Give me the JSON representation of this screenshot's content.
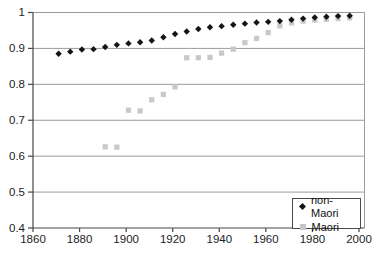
{
  "chart_data": {
    "type": "scatter",
    "title": "",
    "xlabel": "",
    "ylabel": "",
    "xlim": [
      1860,
      2000
    ],
    "ylim": [
      0.4,
      1.0
    ],
    "x_tick_values": [
      1860,
      1880,
      1900,
      1920,
      1940,
      1960,
      1980,
      2000
    ],
    "x_tick_labels": [
      "1860",
      "1880",
      "1900",
      "1920",
      "1940",
      "1960",
      "1980",
      "2000"
    ],
    "y_tick_values": [
      0.4,
      0.5,
      0.6,
      0.7,
      0.8,
      0.9,
      1
    ],
    "y_tick_labels": [
      "0.4",
      "0.5",
      "0.6",
      "0.7",
      "0.8",
      "0.9",
      "1"
    ],
    "grid": "horizontal",
    "legend_position": "bottom-right",
    "colors": {
      "background": "#ffffff",
      "grid": "#9b9b9b",
      "axis": "#474747",
      "text": "#1c1c1c",
      "legend_border": "#4a4a4a"
    },
    "series": [
      {
        "name": "non-Maori",
        "marker": "diamond",
        "color": "#151515",
        "points": [
          [
            1871,
            0.885
          ],
          [
            1876,
            0.891
          ],
          [
            1881,
            0.897
          ],
          [
            1886,
            0.898
          ],
          [
            1891,
            0.904
          ],
          [
            1896,
            0.91
          ],
          [
            1901,
            0.914
          ],
          [
            1906,
            0.917
          ],
          [
            1911,
            0.922
          ],
          [
            1916,
            0.931
          ],
          [
            1921,
            0.94
          ],
          [
            1926,
            0.947
          ],
          [
            1931,
            0.954
          ],
          [
            1936,
            0.959
          ],
          [
            1941,
            0.962
          ],
          [
            1946,
            0.966
          ],
          [
            1951,
            0.969
          ],
          [
            1956,
            0.972
          ],
          [
            1961,
            0.974
          ],
          [
            1966,
            0.976
          ],
          [
            1971,
            0.98
          ],
          [
            1976,
            0.983
          ],
          [
            1981,
            0.986
          ],
          [
            1986,
            0.988
          ],
          [
            1991,
            0.99
          ],
          [
            1996,
            0.991
          ]
        ]
      },
      {
        "name": "Maori",
        "marker": "square",
        "color": "#c8c8c8",
        "points": [
          [
            1891,
            0.626
          ],
          [
            1896,
            0.625
          ],
          [
            1901,
            0.728
          ],
          [
            1906,
            0.726
          ],
          [
            1911,
            0.757
          ],
          [
            1916,
            0.772
          ],
          [
            1921,
            0.793
          ],
          [
            1926,
            0.874
          ],
          [
            1931,
            0.874
          ],
          [
            1936,
            0.875
          ],
          [
            1941,
            0.887
          ],
          [
            1946,
            0.898
          ],
          [
            1951,
            0.916
          ],
          [
            1956,
            0.928
          ],
          [
            1961,
            0.944
          ],
          [
            1966,
            0.963
          ],
          [
            1971,
            0.971
          ],
          [
            1976,
            0.976
          ],
          [
            1981,
            0.979
          ],
          [
            1986,
            0.981
          ],
          [
            1991,
            0.983
          ],
          [
            1996,
            0.985
          ]
        ]
      }
    ]
  }
}
